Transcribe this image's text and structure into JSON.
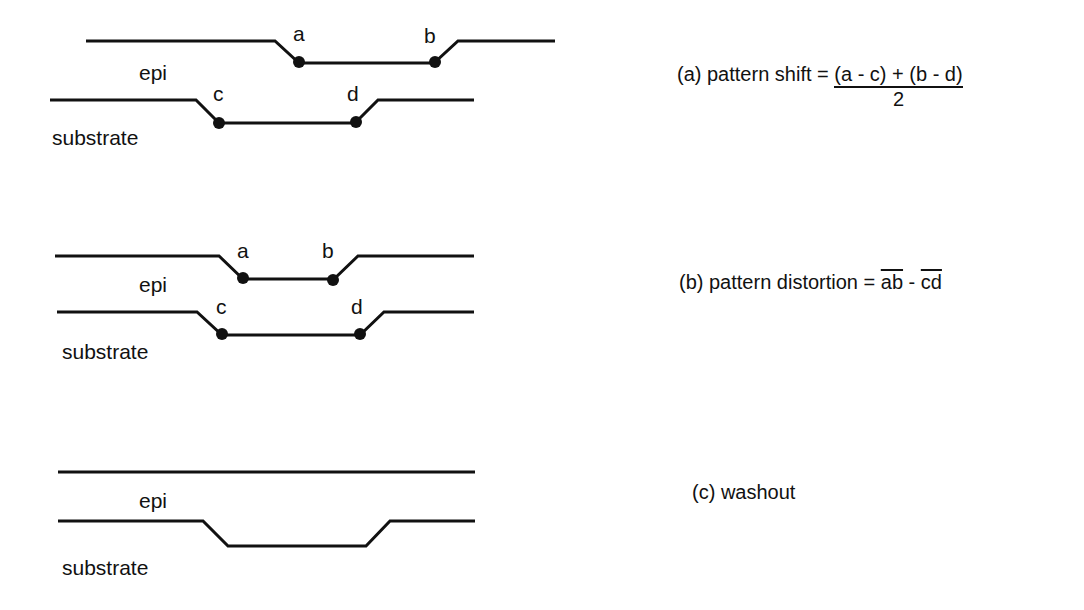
{
  "panels": [
    {
      "id": "a",
      "layers": {
        "top": "epi",
        "bottom": "substrate"
      },
      "points": [
        "a",
        "b",
        "c",
        "d"
      ],
      "caption": {
        "prefix": "(a) pattern shift = ",
        "numerator": "(a - c) + (b - d)",
        "denominator": "2"
      }
    },
    {
      "id": "b",
      "layers": {
        "top": "epi",
        "bottom": "substrate"
      },
      "points": [
        "a",
        "b",
        "c",
        "d"
      ],
      "caption": {
        "prefix": "(b) pattern distortion = ",
        "term1": "ab",
        "minus": " - ",
        "term2": "cd"
      }
    },
    {
      "id": "c",
      "layers": {
        "top": "epi",
        "bottom": "substrate"
      },
      "caption": {
        "text": "(c) washout"
      }
    }
  ],
  "colors": {
    "line": "#111111",
    "background": "#ffffff"
  }
}
